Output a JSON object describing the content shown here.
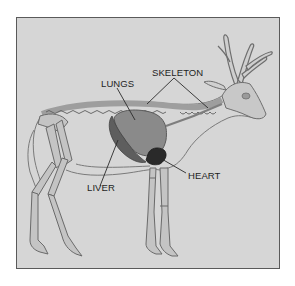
{
  "diagram": {
    "labels": {
      "lungs": "LUNGS",
      "skeleton": "SKELETON",
      "heart": "HEART",
      "liver": "LIVER"
    },
    "colors": {
      "background": "#d6d6d6",
      "frame_border": "#5a5a5a",
      "bone": "#c2c2c2",
      "outline": "#6e6e6e",
      "lungs": "#8a8a8a",
      "liver": "#5e5e5e",
      "heart": "#2a2a2a",
      "text": "#1e1e1e"
    }
  }
}
